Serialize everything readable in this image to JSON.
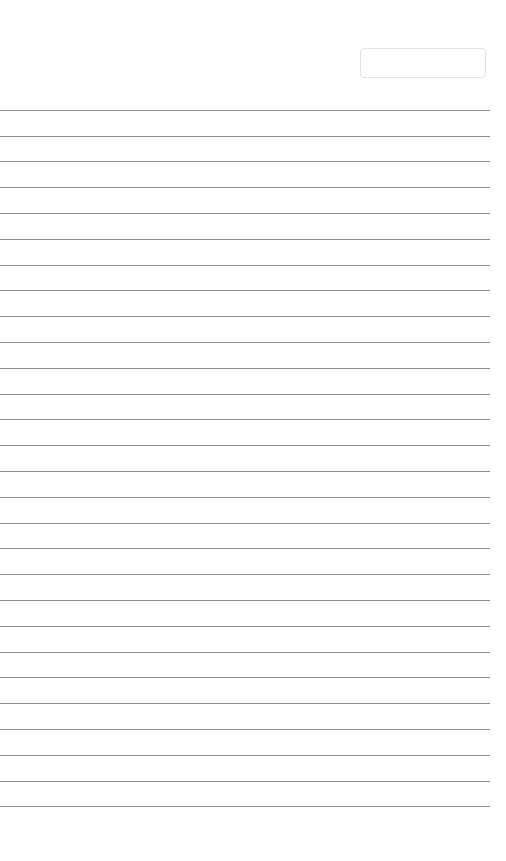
{
  "page": {
    "width": 506,
    "height": 861,
    "background_color": "#ffffff",
    "kind": "lined-paper-sheet",
    "content_text": ""
  },
  "header": {
    "title_field": {
      "value": "",
      "placeholder": "",
      "x": 360,
      "y": 48,
      "width": 126,
      "height": 30,
      "border_color": "#e2e2e2",
      "background_color": "#ffffff",
      "corner_radius": 4
    }
  },
  "ruled_sheet": {
    "line_color": "#8a8a8a",
    "line_thickness": 1,
    "first_line_y": 110,
    "line_spacing": 25.8,
    "line_count": 28,
    "line_left": 0,
    "line_right": 490,
    "lines": [
      {
        "index": 1,
        "y": 110,
        "text": ""
      },
      {
        "index": 2,
        "y": 136,
        "text": ""
      },
      {
        "index": 3,
        "y": 161,
        "text": ""
      },
      {
        "index": 4,
        "y": 187,
        "text": ""
      },
      {
        "index": 5,
        "y": 213,
        "text": ""
      },
      {
        "index": 6,
        "y": 239,
        "text": ""
      },
      {
        "index": 7,
        "y": 265,
        "text": ""
      },
      {
        "index": 8,
        "y": 290,
        "text": ""
      },
      {
        "index": 9,
        "y": 316,
        "text": ""
      },
      {
        "index": 10,
        "y": 342,
        "text": ""
      },
      {
        "index": 11,
        "y": 368,
        "text": ""
      },
      {
        "index": 12,
        "y": 394,
        "text": ""
      },
      {
        "index": 13,
        "y": 419,
        "text": ""
      },
      {
        "index": 14,
        "y": 445,
        "text": ""
      },
      {
        "index": 15,
        "y": 471,
        "text": ""
      },
      {
        "index": 16,
        "y": 497,
        "text": ""
      },
      {
        "index": 17,
        "y": 523,
        "text": ""
      },
      {
        "index": 18,
        "y": 548,
        "text": ""
      },
      {
        "index": 19,
        "y": 574,
        "text": ""
      },
      {
        "index": 20,
        "y": 600,
        "text": ""
      },
      {
        "index": 21,
        "y": 626,
        "text": ""
      },
      {
        "index": 22,
        "y": 652,
        "text": ""
      },
      {
        "index": 23,
        "y": 677,
        "text": ""
      },
      {
        "index": 24,
        "y": 703,
        "text": ""
      },
      {
        "index": 25,
        "y": 729,
        "text": ""
      },
      {
        "index": 26,
        "y": 755,
        "text": ""
      },
      {
        "index": 27,
        "y": 781,
        "text": ""
      },
      {
        "index": 28,
        "y": 806,
        "text": ""
      }
    ]
  }
}
